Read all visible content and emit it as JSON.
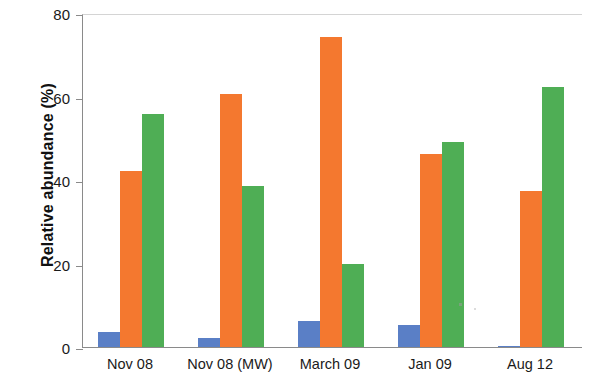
{
  "chart_data": {
    "type": "bar",
    "title": "",
    "subtitle": "",
    "xlabel": "",
    "ylabel": "Relative abundance (%)",
    "categories": [
      "Nov 08",
      "Nov 08 (MW)",
      "March 09",
      "Jan 09",
      "Aug 12"
    ],
    "series": [
      {
        "name": "series-1",
        "color": "#5a7fc6",
        "values": [
          3.6,
          2.2,
          6.2,
          5.3,
          0.3
        ]
      },
      {
        "name": "series-2",
        "color": "#f4782f",
        "values": [
          42.2,
          60.5,
          74.3,
          46.2,
          37.3
        ]
      },
      {
        "name": "series-3",
        "color": "#4fae55",
        "values": [
          55.8,
          38.5,
          20.0,
          49.2,
          62.3
        ]
      }
    ],
    "ylim": [
      0,
      80
    ],
    "yticks": [
      0,
      20,
      40,
      60,
      80
    ],
    "ytick_labels": [
      "0",
      "20",
      "40",
      "60",
      "80"
    ],
    "grid": false,
    "legend": "none",
    "legend_position": "none",
    "annotations": []
  },
  "axis": {
    "y_title": "Relative abundance (%)"
  }
}
